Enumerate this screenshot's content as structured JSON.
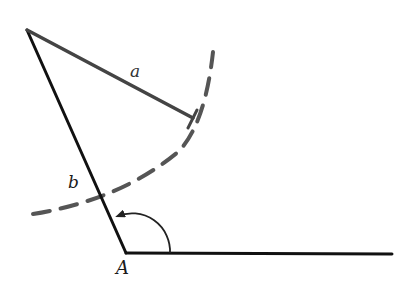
{
  "diagram": {
    "type": "geometric-construction",
    "labels": {
      "side_a": "a",
      "side_b": "b",
      "vertex_A": "A"
    },
    "points": {
      "top_vertex": [
        27,
        30
      ],
      "vertex_A": [
        126,
        253
      ],
      "ray_end": [
        392,
        254
      ],
      "segment_a_end": [
        193,
        118
      ]
    },
    "colors": {
      "background": "#ffffff",
      "solid_line": "#111111",
      "segment_a": "#444444",
      "dashed_arc": "#555555",
      "angle_arc": "#222222"
    },
    "arc": {
      "style": "dashed",
      "radius": 185
    }
  }
}
